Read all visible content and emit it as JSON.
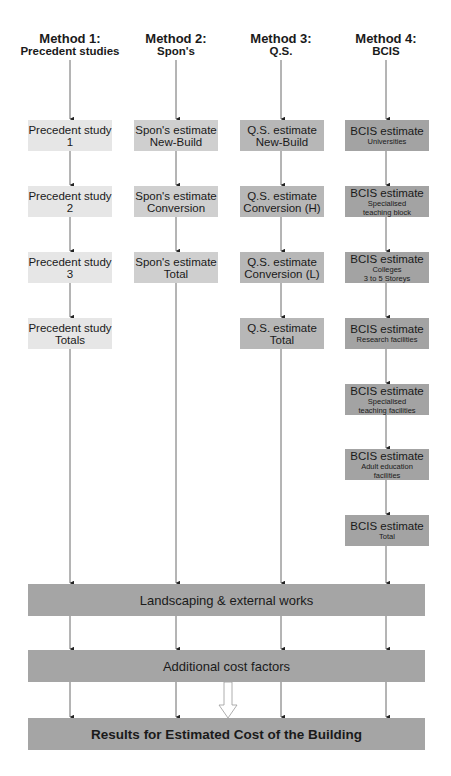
{
  "diagram": {
    "columns": [
      {
        "title": "Method 1:",
        "subtitle": "Precedent studies",
        "color": "#e6e6e6",
        "boxes": [
          {
            "main": "Precedent study",
            "sub": "1",
            "sub_small": false
          },
          {
            "main": "Precedent study",
            "sub": "2",
            "sub_small": false
          },
          {
            "main": "Precedent study",
            "sub": "3",
            "sub_small": false
          },
          {
            "main": "Precedent study",
            "sub": "Totals",
            "sub_small": false
          }
        ]
      },
      {
        "title": "Method 2:",
        "subtitle": "Spon's",
        "color": "#cfcfcf",
        "boxes": [
          {
            "main": "Spon's estimate",
            "sub": "New-Build"
          },
          {
            "main": "Spon's estimate",
            "sub": "Conversion"
          },
          {
            "main": "Spon's estimate",
            "sub": "Total"
          }
        ]
      },
      {
        "title": "Method 3:",
        "subtitle": "Q.S.",
        "color": "#b7b7b7",
        "boxes": [
          {
            "main": "Q.S. estimate",
            "sub": "New-Build"
          },
          {
            "main": "Q.S. estimate",
            "sub": "Conversion (H)"
          },
          {
            "main": "Q.S. estimate",
            "sub": "Conversion (L)"
          },
          {
            "main": "Q.S. estimate",
            "sub": "Total"
          }
        ]
      },
      {
        "title": "Method 4:",
        "subtitle": "BCIS",
        "color": "#a3a3a3",
        "boxes": [
          {
            "main": "BCIS estimate",
            "sub1": "Universities",
            "sub2": ""
          },
          {
            "main": "BCIS estimate",
            "sub1": "Specialised",
            "sub2": "teaching block"
          },
          {
            "main": "BCIS estimate",
            "sub1": "Colleges",
            "sub2": "3 to 5 Storeys"
          },
          {
            "main": "BCIS estimate",
            "sub1": "Research facilities",
            "sub2": ""
          },
          {
            "main": "BCIS estimate",
            "sub1": "Specialised",
            "sub2": "teaching facilities"
          },
          {
            "main": "BCIS estimate",
            "sub1": "Adult education",
            "sub2": "facilities"
          },
          {
            "main": "BCIS estimate",
            "sub1": "Total",
            "sub2": ""
          }
        ]
      }
    ],
    "bars": [
      {
        "label": "Landscaping & external works"
      },
      {
        "label": "Additional cost factors"
      },
      {
        "label": "Results for Estimated Cost of the Building"
      }
    ],
    "bar_color": "#a5a5a5"
  }
}
